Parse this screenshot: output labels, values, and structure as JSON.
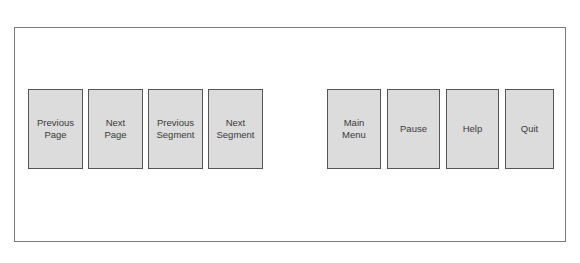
{
  "colors": {
    "frame_border": "#7a7a7a",
    "button_fill": "#dcdcdc",
    "button_border": "#555555",
    "label_text": "#3a3a3a"
  },
  "navigation_group": {
    "buttons": [
      {
        "label": "Previous\nPage"
      },
      {
        "label": "Next\nPage"
      },
      {
        "label": "Previous\nSegment"
      },
      {
        "label": "Next\nSegment"
      }
    ]
  },
  "control_group": {
    "buttons": [
      {
        "label": "Main\nMenu"
      },
      {
        "label": "Pause"
      },
      {
        "label": "Help"
      },
      {
        "label": "Quit"
      }
    ]
  }
}
